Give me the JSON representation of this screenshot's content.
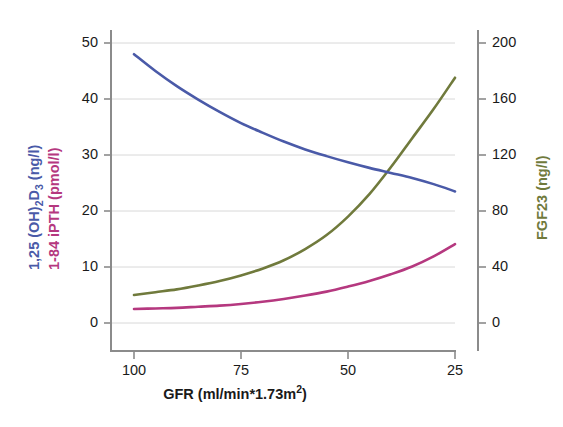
{
  "chart_data": {
    "type": "line",
    "title": "",
    "xlabel": "GFR (ml/min*1.73m2)",
    "xlabel_parts": {
      "main": "GFR (ml/min*1.73m",
      "sup": "2",
      "tail": ")"
    },
    "x_axis": {
      "ticks": [
        100,
        75,
        50,
        25
      ],
      "tick_labels": [
        "100",
        "75",
        "50",
        "25"
      ],
      "range": [
        105,
        22
      ],
      "reversed": true
    },
    "y_axis_left": {
      "label_line1": "1,25 (OH)2D3 (ng/l)",
      "label_line1_parts": {
        "a": "1,25 (OH)",
        "sub1": "2",
        "b": "D",
        "sub2": "3",
        "c": " (ng/l)"
      },
      "label_line2": "1-84 iPTH (pmol/l)",
      "ticks": [
        0,
        10,
        20,
        30,
        40,
        50
      ],
      "tick_labels": [
        "0",
        "10",
        "20",
        "30",
        "40",
        "50"
      ],
      "range": [
        -2,
        52
      ],
      "grid": true
    },
    "y_axis_right": {
      "label": "FGF23 (ng/l)",
      "ticks": [
        0,
        40,
        80,
        120,
        160,
        200
      ],
      "tick_labels": [
        "0",
        "40",
        "80",
        "120",
        "160",
        "200"
      ],
      "range": [
        -8,
        208
      ]
    },
    "legend": {
      "position": "axis-labels",
      "entries": [
        "1,25 (OH)2D3 (ng/l)",
        "1-84 iPTH (pmol/l)",
        "FGF23 (ng/l)"
      ]
    },
    "series": [
      {
        "name": "1,25 (OH)2D3",
        "axis": "left",
        "units": "ng/l",
        "color": "#4a5aa8",
        "x": [
          100,
          95,
          90,
          85,
          80,
          75,
          70,
          65,
          60,
          55,
          50,
          45,
          40,
          35,
          30,
          25
        ],
        "values": [
          48.0,
          45.0,
          42.3,
          39.9,
          37.7,
          35.7,
          34.0,
          32.4,
          31.0,
          29.8,
          28.7,
          27.7,
          26.8,
          25.9,
          24.8,
          23.5
        ]
      },
      {
        "name": "1-84 iPTH",
        "axis": "left",
        "units": "pmol/l",
        "color": "#b5387f",
        "x": [
          100,
          95,
          90,
          85,
          80,
          75,
          70,
          65,
          60,
          55,
          50,
          45,
          40,
          35,
          30,
          25
        ],
        "values": [
          2.5,
          2.6,
          2.7,
          2.9,
          3.1,
          3.4,
          3.8,
          4.3,
          4.9,
          5.6,
          6.5,
          7.5,
          8.7,
          10.1,
          11.9,
          14.1
        ]
      },
      {
        "name": "FGF23",
        "axis": "right",
        "units": "ng/l",
        "color": "#707a3c",
        "x": [
          100,
          95,
          90,
          85,
          80,
          75,
          70,
          65,
          60,
          55,
          50,
          45,
          40,
          35,
          30,
          25
        ],
        "values": [
          20,
          22,
          24,
          27,
          30,
          34,
          39,
          45,
          53,
          63,
          76,
          92,
          111,
          132,
          153,
          175
        ],
        "values_left_scale": [
          5.0,
          5.5,
          6.0,
          6.7,
          7.5,
          8.5,
          9.7,
          11.2,
          13.2,
          15.7,
          19.0,
          23.0,
          27.8,
          33.0,
          38.2,
          43.8
        ]
      }
    ],
    "colors": {
      "vitd": "#4a5aa8",
      "ipth": "#b5387f",
      "fgf23": "#707a3c",
      "axis": "#8b8b8b",
      "grid": "#d8d8d8",
      "text": "#1a1a1a",
      "background": "#ffffff"
    }
  }
}
